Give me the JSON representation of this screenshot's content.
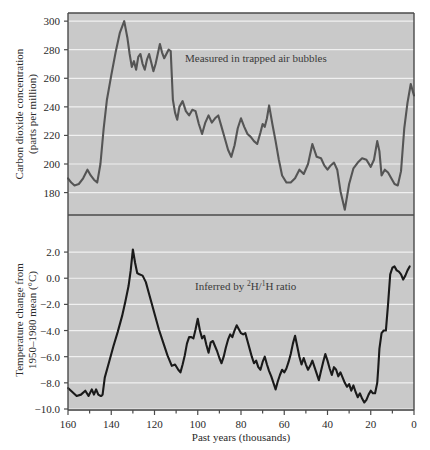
{
  "figure": {
    "name": "vostok-ice-core-figure",
    "background": "#ffffff",
    "panel_fill": "#c9c9c9",
    "gridline_color": "#f0f0f0",
    "border_color": "#4a4a4a"
  },
  "xaxis": {
    "label": "Past years (thousands)",
    "ticks": [
      160,
      140,
      120,
      100,
      80,
      60,
      40,
      20,
      0
    ],
    "minor_ticks": [
      150,
      130,
      110,
      90,
      70,
      50,
      30,
      10
    ],
    "min": 0,
    "max": 160,
    "reversed": true
  },
  "panels": [
    {
      "id": "co2-panel",
      "ylabel_line1": "Carbon dioxide concentration",
      "ylabel_line2": "(parts per million)",
      "annotation": "Measured in trapped air bubbles",
      "yticks": [
        300,
        280,
        260,
        240,
        220,
        200,
        180
      ],
      "ymin": 165,
      "ymax": 305,
      "line_color": "#555555"
    },
    {
      "id": "temperature-panel",
      "ylabel_line1": "Temperature change from",
      "ylabel_line2": "1950–1980 mean (°C)",
      "annotation_pre": "Inferred by ",
      "annotation_sup1": "2",
      "annotation_mid1": "H/",
      "annotation_sup2": "1",
      "annotation_post": "H ratio",
      "annotation_plain": "Inferred by 2H/1H ratio",
      "yticks": [
        "2.0",
        "0.0",
        "-2.0",
        "-4.0",
        "-6.0",
        "-8.0",
        "-10.0"
      ],
      "ytick_values": [
        2.0,
        0.0,
        -2.0,
        -4.0,
        -6.0,
        -8.0,
        -10.0
      ],
      "ymin": -10.0,
      "ymax": 3.0,
      "line_color": "#1a1a1a"
    }
  ],
  "chart_data": {
    "type": "line",
    "title": "",
    "xlabel": "Past years (thousands)",
    "xlim": [
      160,
      0
    ],
    "grid": true,
    "legend": "none",
    "annotations": [
      "Measured in trapped air bubbles",
      "Inferred by 2H/1H ratio"
    ],
    "subplots": [
      {
        "name": "Carbon dioxide concentration",
        "ylabel": "Carbon dioxide concentration (parts per million)",
        "units": "ppm",
        "ylim": [
          165,
          305
        ],
        "yticks": [
          180,
          200,
          220,
          240,
          260,
          280,
          300
        ],
        "series": [
          {
            "name": "CO2",
            "color": "#555555",
            "x": [
              160.0,
              158.5,
              157.0,
              155.0,
              153.0,
              151.0,
              149.5,
              148.0,
              146.5,
              145.0,
              143.5,
              142.0,
              140.0,
              138.0,
              136.0,
              134.0,
              132.5,
              131.5,
              130.5,
              129.5,
              128.5,
              127.5,
              126.5,
              125.5,
              124.5,
              123.5,
              122.5,
              121.5,
              120.5,
              119.5,
              118.5,
              117.5,
              116.5,
              115.5,
              114.5,
              113.5,
              112.5,
              112.0,
              111.5,
              110.5,
              109.5,
              108.5,
              107.0,
              105.5,
              104.0,
              102.5,
              101.0,
              99.5,
              98.0,
              96.5,
              95.0,
              93.5,
              92.0,
              90.5,
              89.0,
              87.5,
              86.0,
              84.5,
              83.0,
              81.5,
              80.0,
              78.5,
              77.0,
              75.5,
              74.0,
              72.5,
              71.0,
              70.0,
              69.0,
              68.0,
              67.0,
              65.5,
              64.0,
              62.5,
              61.0,
              59.0,
              57.0,
              55.0,
              53.0,
              51.0,
              49.0,
              47.0,
              45.0,
              43.0,
              41.5,
              40.0,
              38.5,
              37.0,
              35.5,
              34.0,
              32.0,
              30.0,
              28.0,
              26.0,
              24.0,
              22.0,
              20.0,
              18.5,
              17.0,
              16.0,
              15.0,
              13.5,
              12.0,
              10.5,
              9.0,
              7.5,
              6.0,
              4.5,
              3.0,
              1.5,
              0.0
            ],
            "y": [
              190.0,
              187.0,
              185.0,
              186.0,
              190.0,
              196.0,
              192.0,
              189.0,
              187.0,
              200.0,
              225.0,
              245.0,
              262.0,
              278.0,
              292.0,
              300.0,
              288.0,
              277.0,
              268.0,
              272.0,
              266.0,
              275.0,
              277.0,
              270.0,
              266.0,
              273.0,
              277.0,
              271.0,
              265.0,
              270.0,
              277.0,
              284.0,
              278.0,
              274.0,
              277.0,
              280.0,
              279.0,
              262.0,
              245.0,
              236.0,
              231.0,
              240.0,
              244.0,
              237.0,
              234.0,
              238.0,
              237.0,
              228.0,
              221.0,
              229.0,
              234.0,
              229.0,
              232.0,
              234.0,
              226.0,
              218.0,
              210.0,
              205.0,
              213.0,
              225.0,
              232.0,
              226.0,
              221.0,
              219.0,
              216.0,
              214.0,
              222.0,
              228.0,
              226.0,
              232.0,
              241.0,
              228.0,
              216.0,
              203.0,
              192.0,
              187.0,
              187.0,
              190.0,
              196.0,
              193.0,
              200.0,
              214.0,
              205.0,
              204.0,
              199.0,
              196.0,
              199.0,
              201.0,
              196.0,
              181.0,
              168.0,
              186.0,
              197.0,
              201.0,
              204.0,
              203.0,
              198.0,
              203.0,
              216.0,
              209.0,
              192.0,
              196.0,
              194.0,
              190.0,
              186.0,
              185.0,
              195.0,
              225.0,
              243.0,
              256.0,
              248.0,
              262.0,
              277.0
            ]
          }
        ]
      },
      {
        "name": "Temperature change",
        "ylabel": "Temperature change from 1950-1980 mean (degrees C)",
        "units": "°C",
        "ylim": [
          -10.0,
          3.0
        ],
        "yticks": [
          -10.0,
          -8.0,
          -6.0,
          -4.0,
          -2.0,
          0.0,
          2.0
        ],
        "series": [
          {
            "name": "Temperature anomaly",
            "color": "#1a1a1a",
            "x": [
              160.0,
              158.0,
              156.0,
              154.0,
              152.0,
              150.5,
              149.0,
              148.0,
              147.0,
              146.0,
              145.0,
              144.5,
              144.0,
              143.0,
              141.0,
              139.0,
              137.0,
              135.0,
              133.5,
              132.0,
              131.0,
              130.0,
              129.0,
              128.0,
              127.0,
              125.5,
              124.0,
              122.5,
              121.0,
              119.5,
              118.0,
              116.0,
              114.0,
              112.0,
              110.5,
              109.0,
              108.0,
              107.0,
              106.0,
              105.0,
              104.0,
              103.0,
              102.0,
              101.0,
              100.0,
              99.0,
              98.0,
              97.0,
              96.0,
              95.0,
              94.0,
              93.0,
              92.0,
              91.0,
              90.0,
              89.0,
              88.0,
              87.0,
              86.0,
              85.0,
              84.0,
              83.0,
              82.0,
              81.0,
              80.0,
              79.0,
              78.0,
              77.0,
              76.0,
              75.0,
              74.0,
              73.0,
              72.0,
              71.0,
              70.0,
              69.0,
              68.0,
              67.0,
              66.0,
              65.0,
              64.0,
              63.0,
              62.0,
              61.0,
              60.0,
              59.0,
              58.0,
              57.0,
              56.0,
              55.0,
              54.0,
              53.0,
              52.0,
              51.0,
              50.0,
              49.0,
              48.0,
              47.0,
              46.0,
              45.0,
              44.0,
              43.0,
              42.0,
              41.0,
              40.0,
              39.0,
              38.0,
              37.0,
              36.0,
              35.0,
              34.0,
              33.0,
              32.0,
              31.0,
              30.0,
              29.0,
              28.0,
              27.0,
              26.0,
              25.0,
              24.0,
              23.0,
              22.0,
              21.0,
              20.0,
              19.0,
              18.0,
              17.0,
              16.5,
              16.0,
              15.0,
              14.0,
              13.0,
              12.0,
              11.0,
              10.0,
              9.0,
              8.0,
              7.0,
              6.0,
              5.0,
              4.0,
              3.0,
              2.0,
              1.0,
              0.0
            ],
            "y": [
              -8.4,
              -8.7,
              -9.0,
              -8.9,
              -8.6,
              -9.0,
              -8.5,
              -8.9,
              -8.5,
              -8.9,
              -9.0,
              -9.0,
              -8.9,
              -7.6,
              -6.4,
              -5.2,
              -4.1,
              -2.9,
              -1.8,
              -0.6,
              0.6,
              2.2,
              1.2,
              0.4,
              0.3,
              0.2,
              -0.3,
              -1.2,
              -2.1,
              -3.0,
              -3.9,
              -4.9,
              -5.9,
              -6.7,
              -6.6,
              -7.0,
              -7.2,
              -6.6,
              -5.9,
              -5.0,
              -4.5,
              -4.5,
              -4.6,
              -3.9,
              -3.1,
              -4.0,
              -4.6,
              -4.4,
              -5.1,
              -5.7,
              -4.9,
              -4.8,
              -5.2,
              -5.6,
              -6.1,
              -6.5,
              -6.0,
              -5.3,
              -4.7,
              -4.3,
              -4.5,
              -4.0,
              -3.6,
              -3.9,
              -4.2,
              -4.3,
              -4.2,
              -4.8,
              -5.4,
              -6.0,
              -6.5,
              -6.3,
              -6.8,
              -7.0,
              -6.4,
              -6.0,
              -6.6,
              -7.1,
              -7.5,
              -8.0,
              -8.5,
              -7.9,
              -7.4,
              -7.0,
              -7.2,
              -6.9,
              -6.4,
              -5.8,
              -5.0,
              -4.4,
              -5.2,
              -6.0,
              -6.6,
              -6.1,
              -6.6,
              -7.0,
              -6.7,
              -6.3,
              -6.8,
              -7.3,
              -7.8,
              -7.1,
              -6.4,
              -5.8,
              -6.3,
              -6.9,
              -7.4,
              -6.8,
              -7.0,
              -7.5,
              -7.2,
              -7.6,
              -8.0,
              -8.3,
              -8.1,
              -8.6,
              -8.2,
              -8.7,
              -9.1,
              -8.8,
              -9.2,
              -9.5,
              -9.3,
              -8.9,
              -8.6,
              -8.8,
              -8.8,
              -8.0,
              -6.8,
              -5.4,
              -4.2,
              -4.0,
              -4.0,
              -2.0,
              0.3,
              0.8,
              0.9,
              0.6,
              0.5,
              0.3,
              -0.1,
              0.2,
              0.6,
              0.9
            ]
          }
        ]
      }
    ]
  }
}
